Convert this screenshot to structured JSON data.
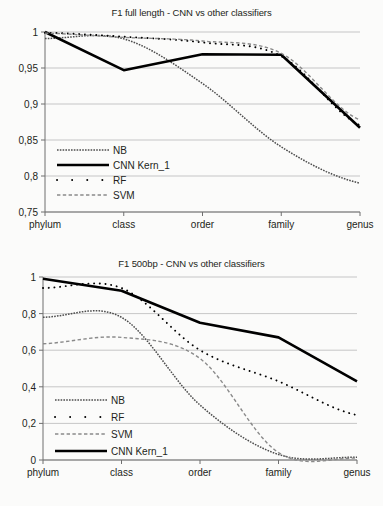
{
  "page": {
    "background": "#fbfbfa",
    "ink": "#231f20",
    "grid_color": "#b9b9b9"
  },
  "charts": [
    {
      "id": "f1-full-length",
      "title": "F1 full length - CNN vs other classifiers",
      "type": "line",
      "xlabel": "",
      "ylabel": "",
      "categories": [
        "phylum",
        "class",
        "order",
        "family",
        "genus"
      ],
      "yticks": [
        "1",
        "0,95",
        "0,9",
        "0,85",
        "0,8",
        "0,75"
      ],
      "ytick_values": [
        1,
        0.95,
        0.9,
        0.85,
        0.8,
        0.75
      ],
      "ylim": [
        0.75,
        1.0
      ],
      "grid": "horizontal",
      "legend_position": "lower-left-inside",
      "legend": [
        {
          "label": "NB",
          "style": "fine-dotted",
          "color": "#4d4d4d"
        },
        {
          "label": "CNN Kern_1",
          "style": "thick-solid",
          "color": "#000000"
        },
        {
          "label": "RF",
          "style": "sparse-dots",
          "color": "#000000"
        },
        {
          "label": "SVM",
          "style": "dashed",
          "color": "#8a8a8a"
        }
      ],
      "series": [
        {
          "name": "NB",
          "style": "fine-dotted",
          "color": "#4d4d4d",
          "values": [
            0.991,
            0.9905,
            0.9285,
            0.8405,
            0.79
          ]
        },
        {
          "name": "CNN Kern_1",
          "style": "thick-solid",
          "color": "#000000",
          "values": [
            1.0,
            0.947,
            0.969,
            0.9685,
            0.867
          ]
        },
        {
          "name": "RF",
          "style": "sparse-dots",
          "color": "#000000",
          "values": [
            0.999,
            0.9935,
            0.9855,
            0.9665,
            0.8705
          ]
        },
        {
          "name": "SVM",
          "style": "dashed",
          "color": "#8a8a8a",
          "values": [
            0.9985,
            0.9925,
            0.9875,
            0.9705,
            0.8775
          ]
        }
      ]
    },
    {
      "id": "f1-500bp",
      "title": "F1 500bp - CNN vs other classifiers",
      "type": "line",
      "xlabel": "",
      "ylabel": "",
      "categories": [
        "phylum",
        "class",
        "order",
        "family",
        "genus"
      ],
      "yticks": [
        "1",
        "0,8",
        "0,6",
        "0,4",
        "0,2",
        "0"
      ],
      "ytick_values": [
        1,
        0.8,
        0.6,
        0.4,
        0.2,
        0
      ],
      "ylim": [
        0,
        1.0
      ],
      "grid": "horizontal",
      "legend_position": "lower-left-inside",
      "legend": [
        {
          "label": "NB",
          "style": "fine-dotted",
          "color": "#4d4d4d"
        },
        {
          "label": "RF",
          "style": "sparse-dots",
          "color": "#000000"
        },
        {
          "label": "SVM",
          "style": "dashed",
          "color": "#8a8a8a"
        },
        {
          "label": "CNN Kern_1",
          "style": "thick-solid",
          "color": "#000000"
        }
      ],
      "series": [
        {
          "name": "NB",
          "style": "fine-dotted",
          "color": "#4d4d4d",
          "values": [
            0.78,
            0.78,
            0.3,
            0.03,
            0.015
          ]
        },
        {
          "name": "RF",
          "style": "sparse-dots",
          "color": "#000000",
          "values": [
            0.94,
            0.94,
            0.6,
            0.43,
            0.245
          ]
        },
        {
          "name": "SVM",
          "style": "dashed",
          "color": "#8a8a8a",
          "values": [
            0.635,
            0.67,
            0.555,
            0.04,
            0.01
          ]
        },
        {
          "name": "CNN Kern_1",
          "style": "thick-solid",
          "color": "#000000",
          "values": [
            0.99,
            0.925,
            0.75,
            0.67,
            0.43
          ]
        }
      ]
    }
  ]
}
